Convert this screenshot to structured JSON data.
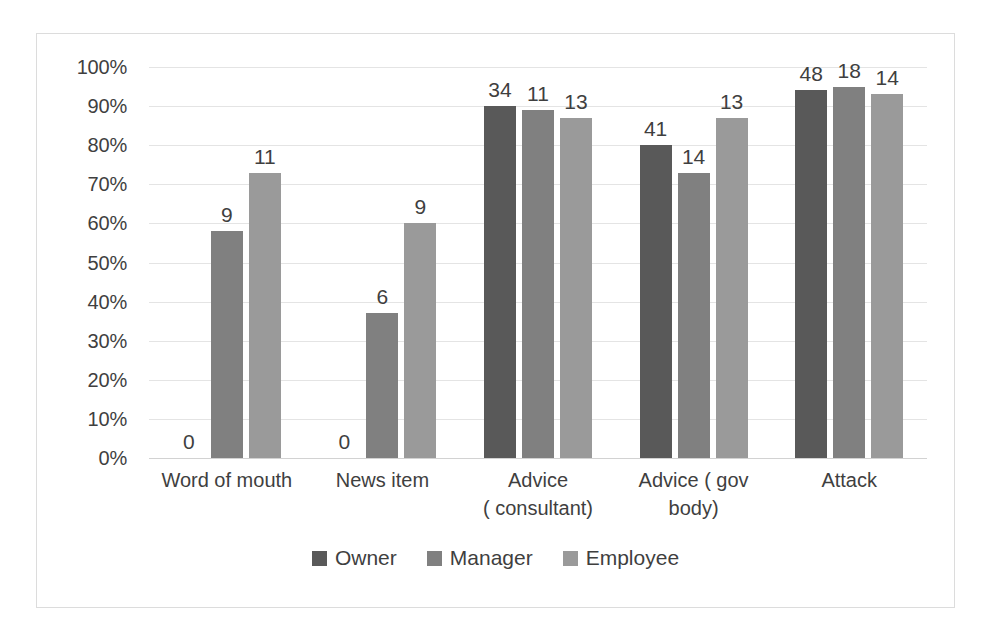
{
  "chart_data": {
    "type": "bar",
    "title": "",
    "xlabel": "",
    "ylabel": "",
    "ylim": [
      0,
      100
    ],
    "grid": true,
    "legend_position": "bottom",
    "categories": [
      "Word of mouth",
      "News item",
      "Advice\n( consultant)",
      "Advice ( gov\nbody)",
      "Attack"
    ],
    "ytick_labels": [
      "100%",
      "90%",
      "80%",
      "70%",
      "60%",
      "50%",
      "40%",
      "30%",
      "20%",
      "10%",
      "0%"
    ],
    "ytick_values": [
      100,
      90,
      80,
      70,
      60,
      50,
      40,
      30,
      20,
      10,
      0
    ],
    "series": [
      {
        "name": "Owner",
        "color": "#595959",
        "values": [
          0,
          0,
          90,
          80,
          94
        ],
        "data_labels": [
          "0",
          "0",
          "34",
          "41",
          "48"
        ]
      },
      {
        "name": "Manager",
        "color": "#808080",
        "values": [
          58,
          37,
          89,
          73,
          95
        ],
        "data_labels": [
          "9",
          "6",
          "11",
          "14",
          "18"
        ]
      },
      {
        "name": "Employee",
        "color": "#9a9a9a",
        "values": [
          73,
          60,
          87,
          87,
          93
        ],
        "data_labels": [
          "11",
          "9",
          "13",
          "13",
          "14"
        ]
      }
    ]
  }
}
